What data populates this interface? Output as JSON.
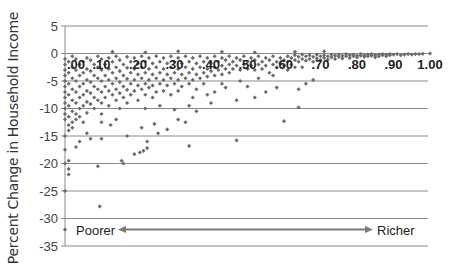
{
  "chart_data": {
    "type": "scatter",
    "title": "",
    "xlabel": "",
    "ylabel": "Percent Change in Household Income",
    "xlim": [
      0.0,
      1.0
    ],
    "ylim": [
      -35,
      5
    ],
    "x_ticks": [
      ".00",
      ".10",
      ".20",
      ".30",
      ".40",
      ".50",
      ".60",
      ".70",
      ".80",
      ".90",
      "1.00"
    ],
    "y_ticks": [
      "5",
      "0",
      "-5",
      "-10",
      "-15",
      "-20",
      "-25",
      "-30",
      "-35"
    ],
    "grid": {
      "horizontal": true,
      "vertical": false
    },
    "marker_color": "#6b6b6b",
    "annotations": {
      "left_label": "Poorer",
      "right_label": "Richer",
      "arrow": "double-headed arrow from Poorer to Richer at y = -32",
      "arrow_color": "#7a7a7a"
    },
    "note": "Points are approximate readings of a dense cloud (~500+ households); representative subset listed.",
    "points": [
      [
        0.0,
        -32.0
      ],
      [
        0.0,
        -25.0
      ],
      [
        0.0,
        -20.0
      ],
      [
        0.01,
        -19.5
      ],
      [
        0.01,
        -21.0
      ],
      [
        0.0,
        -17.5
      ],
      [
        0.01,
        -22.0
      ],
      [
        0.095,
        -27.8
      ],
      [
        0.09,
        -20.5
      ],
      [
        0.16,
        -20.0
      ],
      [
        0.155,
        -19.5
      ],
      [
        0.0,
        -15.0
      ],
      [
        0.01,
        -14.0
      ],
      [
        0.02,
        -13.5
      ],
      [
        0.03,
        -12.0
      ],
      [
        0.04,
        -11.5
      ],
      [
        0.05,
        -12.5
      ],
      [
        0.06,
        -14.5
      ],
      [
        0.07,
        -15.5
      ],
      [
        0.04,
        -16.0
      ],
      [
        0.03,
        -17.0
      ],
      [
        0.1,
        -15.5
      ],
      [
        0.125,
        -13.0
      ],
      [
        0.1,
        -12.5
      ],
      [
        0.14,
        -12.0
      ],
      [
        0.19,
        -18.3
      ],
      [
        0.205,
        -18.0
      ],
      [
        0.215,
        -17.7
      ],
      [
        0.225,
        -17.2
      ],
      [
        0.225,
        -16.0
      ],
      [
        0.255,
        -14.5
      ],
      [
        0.34,
        -16.8
      ],
      [
        0.47,
        -15.8
      ],
      [
        0.6,
        -12.3
      ],
      [
        0.64,
        -9.8
      ],
      [
        0.17,
        -15.0
      ],
      [
        0.21,
        -13.5
      ],
      [
        0.245,
        -12.8
      ],
      [
        0.28,
        -13.8
      ],
      [
        0.31,
        -12.0
      ],
      [
        0.36,
        -10.5
      ],
      [
        0.33,
        -12.5
      ],
      [
        0.22,
        -10.0
      ],
      [
        0.26,
        -9.5
      ],
      [
        0.3,
        -10.2
      ],
      [
        0.35,
        -8.0
      ],
      [
        0.39,
        -7.5
      ],
      [
        0.41,
        -7.0
      ],
      [
        0.44,
        -6.2
      ],
      [
        0.47,
        -8.5
      ],
      [
        0.52,
        -8.0
      ],
      [
        0.55,
        -7.0
      ],
      [
        0.58,
        -6.2
      ],
      [
        0.4,
        -9.0
      ],
      [
        0.43,
        -5.5
      ],
      [
        0.48,
        -5.0
      ],
      [
        0.5,
        -6.0
      ],
      [
        0.53,
        -4.5
      ],
      [
        0.57,
        -4.0
      ],
      [
        0.61,
        -3.0
      ],
      [
        0.63,
        -2.5
      ],
      [
        0.64,
        -6.5
      ],
      [
        0.66,
        -5.5
      ],
      [
        0.68,
        -4.8
      ],
      [
        0.0,
        -1.0
      ],
      [
        0.0,
        -2.0
      ],
      [
        0.0,
        -3.0
      ],
      [
        0.0,
        -4.0
      ],
      [
        0.0,
        -5.0
      ],
      [
        0.0,
        -6.0
      ],
      [
        0.0,
        -7.0
      ],
      [
        0.0,
        -8.0
      ],
      [
        0.0,
        -9.0
      ],
      [
        0.0,
        -10.0
      ],
      [
        0.0,
        -11.0
      ],
      [
        0.0,
        -12.0
      ],
      [
        0.01,
        -1.5
      ],
      [
        0.01,
        -3.5
      ],
      [
        0.01,
        -5.5
      ],
      [
        0.01,
        -7.5
      ],
      [
        0.01,
        -9.5
      ],
      [
        0.01,
        -11.5
      ],
      [
        0.01,
        -13.0
      ],
      [
        0.02,
        -0.5
      ],
      [
        0.02,
        -2.5
      ],
      [
        0.02,
        -4.5
      ],
      [
        0.02,
        -6.5
      ],
      [
        0.02,
        -8.5
      ],
      [
        0.02,
        -10.5
      ],
      [
        0.02,
        -12.5
      ],
      [
        0.03,
        -1.0
      ],
      [
        0.03,
        -3.0
      ],
      [
        0.03,
        -5.0
      ],
      [
        0.03,
        -7.0
      ],
      [
        0.03,
        -9.0
      ],
      [
        0.03,
        -11.0
      ],
      [
        0.04,
        -2.0
      ],
      [
        0.04,
        -4.0
      ],
      [
        0.04,
        -6.0
      ],
      [
        0.04,
        -8.0
      ],
      [
        0.04,
        -10.0
      ],
      [
        0.05,
        -1.5
      ],
      [
        0.05,
        -3.5
      ],
      [
        0.05,
        -5.5
      ],
      [
        0.05,
        -7.5
      ],
      [
        0.05,
        -9.5
      ],
      [
        0.06,
        -0.8
      ],
      [
        0.06,
        -2.8
      ],
      [
        0.06,
        -4.8
      ],
      [
        0.06,
        -6.8
      ],
      [
        0.06,
        -8.8
      ],
      [
        0.06,
        -10.8
      ],
      [
        0.07,
        -1.2
      ],
      [
        0.07,
        -3.2
      ],
      [
        0.07,
        -5.2
      ],
      [
        0.07,
        -7.2
      ],
      [
        0.07,
        -9.2
      ],
      [
        0.08,
        -2.0
      ],
      [
        0.08,
        -4.0
      ],
      [
        0.08,
        -6.0
      ],
      [
        0.08,
        -8.0
      ],
      [
        0.08,
        -10.0
      ],
      [
        0.09,
        -0.5
      ],
      [
        0.09,
        -2.5
      ],
      [
        0.09,
        -4.5
      ],
      [
        0.09,
        -6.5
      ],
      [
        0.09,
        -8.5
      ],
      [
        0.1,
        -1.0
      ],
      [
        0.1,
        -3.0
      ],
      [
        0.1,
        -5.0
      ],
      [
        0.1,
        -7.0
      ],
      [
        0.1,
        -9.0
      ],
      [
        0.1,
        -11.0
      ],
      [
        0.11,
        -2.0
      ],
      [
        0.11,
        -4.0
      ],
      [
        0.11,
        -6.0
      ],
      [
        0.11,
        -8.0
      ],
      [
        0.12,
        -0.8
      ],
      [
        0.12,
        -2.8
      ],
      [
        0.12,
        -4.8
      ],
      [
        0.12,
        -6.8
      ],
      [
        0.12,
        -9.5
      ],
      [
        0.13,
        -1.5
      ],
      [
        0.13,
        -3.5
      ],
      [
        0.13,
        -5.5
      ],
      [
        0.13,
        -7.5
      ],
      [
        0.14,
        -0.5
      ],
      [
        0.14,
        -2.5
      ],
      [
        0.14,
        -4.5
      ],
      [
        0.14,
        -6.5
      ],
      [
        0.14,
        -8.5
      ],
      [
        0.15,
        -1.2
      ],
      [
        0.15,
        -3.2
      ],
      [
        0.15,
        -5.2
      ],
      [
        0.15,
        -7.2
      ],
      [
        0.15,
        -10.0
      ],
      [
        0.16,
        -2.0
      ],
      [
        0.16,
        -4.0
      ],
      [
        0.16,
        -6.0
      ],
      [
        0.16,
        -8.0
      ],
      [
        0.17,
        -0.6
      ],
      [
        0.17,
        -2.6
      ],
      [
        0.17,
        -4.6
      ],
      [
        0.17,
        -6.6
      ],
      [
        0.17,
        -9.0
      ],
      [
        0.18,
        -1.5
      ],
      [
        0.18,
        -3.5
      ],
      [
        0.18,
        -5.5
      ],
      [
        0.18,
        -7.5
      ],
      [
        0.19,
        -0.8
      ],
      [
        0.19,
        -2.8
      ],
      [
        0.19,
        -4.8
      ],
      [
        0.19,
        -6.8
      ],
      [
        0.2,
        -1.8
      ],
      [
        0.2,
        -3.8
      ],
      [
        0.2,
        -5.8
      ],
      [
        0.2,
        -8.5
      ],
      [
        0.21,
        -0.5
      ],
      [
        0.21,
        -2.5
      ],
      [
        0.21,
        -4.5
      ],
      [
        0.21,
        -6.5
      ],
      [
        0.22,
        -1.5
      ],
      [
        0.22,
        -3.5
      ],
      [
        0.22,
        -5.5
      ],
      [
        0.22,
        -7.5
      ],
      [
        0.23,
        -0.8
      ],
      [
        0.23,
        -2.8
      ],
      [
        0.23,
        -4.8
      ],
      [
        0.23,
        -6.2
      ],
      [
        0.24,
        -1.8
      ],
      [
        0.24,
        -3.8
      ],
      [
        0.24,
        -5.8
      ],
      [
        0.24,
        -8.0
      ],
      [
        0.25,
        -0.5
      ],
      [
        0.25,
        -2.5
      ],
      [
        0.25,
        -4.5
      ],
      [
        0.25,
        -7.0
      ],
      [
        0.26,
        -1.5
      ],
      [
        0.26,
        -3.5
      ],
      [
        0.26,
        -5.5
      ],
      [
        0.27,
        -0.8
      ],
      [
        0.27,
        -2.8
      ],
      [
        0.27,
        -4.8
      ],
      [
        0.27,
        -6.8
      ],
      [
        0.28,
        -1.8
      ],
      [
        0.28,
        -3.8
      ],
      [
        0.28,
        -5.8
      ],
      [
        0.29,
        -0.5
      ],
      [
        0.29,
        -2.5
      ],
      [
        0.29,
        -4.5
      ],
      [
        0.29,
        -7.5
      ],
      [
        0.3,
        -1.5
      ],
      [
        0.3,
        -3.5
      ],
      [
        0.3,
        -5.5
      ],
      [
        0.31,
        -0.8
      ],
      [
        0.31,
        -2.8
      ],
      [
        0.31,
        -4.8
      ],
      [
        0.31,
        -6.8
      ],
      [
        0.32,
        -1.8
      ],
      [
        0.32,
        -3.8
      ],
      [
        0.32,
        -6.0
      ],
      [
        0.33,
        -0.5
      ],
      [
        0.33,
        -2.5
      ],
      [
        0.33,
        -4.5
      ],
      [
        0.34,
        -1.5
      ],
      [
        0.34,
        -3.5
      ],
      [
        0.34,
        -5.5
      ],
      [
        0.34,
        -9.5
      ],
      [
        0.35,
        -0.8
      ],
      [
        0.35,
        -2.8
      ],
      [
        0.35,
        -4.8
      ],
      [
        0.36,
        -1.8
      ],
      [
        0.36,
        -3.8
      ],
      [
        0.36,
        -6.5
      ],
      [
        0.37,
        -0.5
      ],
      [
        0.37,
        -2.5
      ],
      [
        0.37,
        -4.5
      ],
      [
        0.38,
        -1.5
      ],
      [
        0.38,
        -3.5
      ],
      [
        0.38,
        -5.5
      ],
      [
        0.39,
        -0.8
      ],
      [
        0.39,
        -2.8
      ],
      [
        0.39,
        -4.2
      ],
      [
        0.4,
        -1.8
      ],
      [
        0.4,
        -3.2
      ],
      [
        0.41,
        -0.5
      ],
      [
        0.41,
        -2.5
      ],
      [
        0.41,
        -4.0
      ],
      [
        0.42,
        -1.5
      ],
      [
        0.42,
        -3.0
      ],
      [
        0.43,
        -0.8
      ],
      [
        0.43,
        -2.2
      ],
      [
        0.43,
        -3.8
      ],
      [
        0.44,
        -1.2
      ],
      [
        0.44,
        -2.8
      ],
      [
        0.45,
        -0.5
      ],
      [
        0.45,
        -2.0
      ],
      [
        0.45,
        -3.5
      ],
      [
        0.46,
        -1.5
      ],
      [
        0.46,
        -2.8
      ],
      [
        0.47,
        -0.8
      ],
      [
        0.47,
        -2.2
      ],
      [
        0.48,
        -1.2
      ],
      [
        0.48,
        -3.0
      ],
      [
        0.49,
        -0.5
      ],
      [
        0.49,
        -2.0
      ],
      [
        0.5,
        -1.5
      ],
      [
        0.5,
        -2.8
      ],
      [
        0.51,
        -0.8
      ],
      [
        0.51,
        -2.2
      ],
      [
        0.52,
        -1.2
      ],
      [
        0.52,
        -3.0
      ],
      [
        0.53,
        -0.5
      ],
      [
        0.53,
        -2.0
      ],
      [
        0.54,
        -1.5
      ],
      [
        0.54,
        -2.8
      ],
      [
        0.55,
        -0.8
      ],
      [
        0.55,
        -2.2
      ],
      [
        0.56,
        -1.2
      ],
      [
        0.56,
        -3.5
      ],
      [
        0.57,
        -0.5
      ],
      [
        0.57,
        -2.0
      ],
      [
        0.58,
        -1.5
      ],
      [
        0.58,
        -2.5
      ],
      [
        0.59,
        -0.8
      ],
      [
        0.59,
        -1.8
      ],
      [
        0.6,
        -1.2
      ],
      [
        0.6,
        -2.2
      ],
      [
        0.61,
        -0.5
      ],
      [
        0.61,
        -1.5
      ],
      [
        0.62,
        -0.8
      ],
      [
        0.62,
        -2.0
      ],
      [
        0.63,
        -0.3
      ],
      [
        0.63,
        -1.2
      ],
      [
        0.64,
        -0.6
      ],
      [
        0.64,
        -1.5
      ],
      [
        0.65,
        -0.2
      ],
      [
        0.65,
        -1.0
      ],
      [
        0.65,
        -2.5
      ],
      [
        0.66,
        -0.5
      ],
      [
        0.66,
        -1.3
      ],
      [
        0.67,
        -0.3
      ],
      [
        0.67,
        -1.0
      ],
      [
        0.68,
        -0.6
      ],
      [
        0.68,
        -1.5
      ],
      [
        0.69,
        -0.2
      ],
      [
        0.69,
        -0.9
      ],
      [
        0.7,
        -0.5
      ],
      [
        0.7,
        -1.2
      ],
      [
        0.71,
        -0.3
      ],
      [
        0.71,
        -0.8
      ],
      [
        0.72,
        -0.5
      ],
      [
        0.72,
        -1.1
      ],
      [
        0.73,
        -0.2
      ],
      [
        0.73,
        -0.7
      ],
      [
        0.74,
        -0.4
      ],
      [
        0.74,
        -1.0
      ],
      [
        0.75,
        -0.2
      ],
      [
        0.75,
        -0.6
      ],
      [
        0.76,
        -0.4
      ],
      [
        0.76,
        -0.9
      ],
      [
        0.77,
        -0.1
      ],
      [
        0.77,
        -0.5
      ],
      [
        0.78,
        -0.3
      ],
      [
        0.78,
        -0.8
      ],
      [
        0.79,
        -0.2
      ],
      [
        0.79,
        -0.5
      ],
      [
        0.8,
        -0.4
      ],
      [
        0.8,
        -0.7
      ],
      [
        0.81,
        -0.1
      ],
      [
        0.81,
        -0.4
      ],
      [
        0.82,
        -0.3
      ],
      [
        0.82,
        -0.6
      ],
      [
        0.83,
        -0.2
      ],
      [
        0.83,
        -0.5
      ],
      [
        0.84,
        -0.1
      ],
      [
        0.84,
        -0.4
      ],
      [
        0.85,
        -0.3
      ],
      [
        0.85,
        -0.7
      ],
      [
        0.86,
        -0.2
      ],
      [
        0.86,
        -0.5
      ],
      [
        0.87,
        -0.1
      ],
      [
        0.87,
        -0.3
      ],
      [
        0.88,
        -0.2
      ],
      [
        0.88,
        -0.5
      ],
      [
        0.89,
        -0.1
      ],
      [
        0.89,
        -0.3
      ],
      [
        0.9,
        -0.2
      ],
      [
        0.91,
        -0.1
      ],
      [
        0.92,
        -0.3
      ],
      [
        0.93,
        -0.2
      ],
      [
        0.94,
        -0.1
      ],
      [
        0.95,
        -0.2
      ],
      [
        0.96,
        -0.1
      ],
      [
        0.97,
        -0.1
      ],
      [
        0.98,
        -0.05
      ],
      [
        1.0,
        0.0
      ],
      [
        0.13,
        0.3
      ],
      [
        0.22,
        0.2
      ],
      [
        0.31,
        0.4
      ],
      [
        0.43,
        0.3
      ],
      [
        0.52,
        0.2
      ],
      [
        0.63,
        0.3
      ],
      [
        0.71,
        0.4
      ]
    ]
  },
  "axis": {
    "ylabel": "Percent Change in Household Income",
    "y_ticks": [
      "5",
      "0",
      "-5",
      "-10",
      "-15",
      "-20",
      "-25",
      "-30",
      "-35"
    ],
    "x_ticks": [
      ".00",
      ".10",
      ".20",
      ".30",
      ".40",
      ".50",
      ".60",
      ".70",
      ".80",
      ".90",
      "1.00"
    ]
  },
  "annotation": {
    "poorer": "Poorer",
    "richer": "Richer"
  }
}
